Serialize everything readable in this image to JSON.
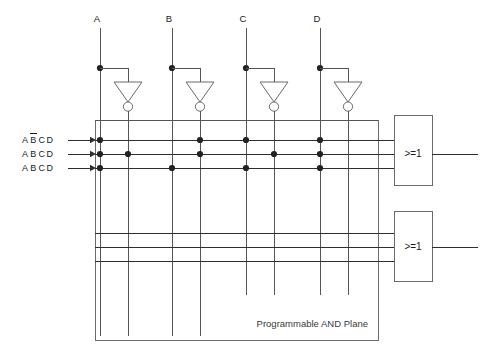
{
  "diagram": {
    "plane_label": "Programmable AND Plane",
    "colors": {
      "wire": "#555555",
      "wire_dark": "#2e2e2e",
      "dot": "#222222",
      "box": "#6b6b6b",
      "text": "#1b1b1b",
      "background": "#ffffff"
    }
  },
  "inputs": [
    {
      "label": "A",
      "x": 100,
      "inv_x": 128
    },
    {
      "label": "B",
      "x": 172,
      "inv_x": 200
    },
    {
      "label": "C",
      "x": 246,
      "inv_x": 274
    },
    {
      "label": "D",
      "x": 320,
      "inv_x": 348
    }
  ],
  "product_terms": [
    {
      "label_parts": [
        {
          "ch": "A",
          "bar": false
        },
        {
          "ch": "B",
          "bar": true
        },
        {
          "ch": "C",
          "bar": false
        },
        {
          "ch": "D",
          "bar": false
        }
      ],
      "y": 140
    },
    {
      "label_parts": [
        {
          "ch": "A",
          "bar": false
        },
        {
          "ch": "B",
          "bar": false
        },
        {
          "ch": "C",
          "bar": false
        },
        {
          "ch": "D",
          "bar": false
        }
      ],
      "y": 154
    },
    {
      "label_parts": [
        {
          "ch": "A",
          "bar": false
        },
        {
          "ch": "B",
          "bar": false
        },
        {
          "ch": "C",
          "bar": false
        },
        {
          "ch": "D",
          "bar": false
        }
      ],
      "y": 168
    }
  ],
  "connection_dots": [
    {
      "x": 100,
      "y": 140
    },
    {
      "x": 200,
      "y": 140
    },
    {
      "x": 246,
      "y": 140
    },
    {
      "x": 320,
      "y": 140
    },
    {
      "x": 100,
      "y": 154
    },
    {
      "x": 128,
      "y": 154
    },
    {
      "x": 200,
      "y": 154
    },
    {
      "x": 274,
      "y": 154
    },
    {
      "x": 320,
      "y": 154
    },
    {
      "x": 100,
      "y": 168
    },
    {
      "x": 172,
      "y": 168
    },
    {
      "x": 246,
      "y": 168
    },
    {
      "x": 320,
      "y": 168
    }
  ],
  "input_tap_dots": [
    {
      "x": 100,
      "y": 68
    },
    {
      "x": 172,
      "y": 68
    },
    {
      "x": 246,
      "y": 68
    },
    {
      "x": 320,
      "y": 68
    }
  ],
  "lower_lines": [
    {
      "y": 233
    },
    {
      "y": 247
    },
    {
      "y": 261
    }
  ],
  "or_gates": [
    {
      "label": ">=1",
      "x": 394,
      "y": 115,
      "w": 38,
      "h": 70,
      "out_y": 154
    },
    {
      "label": ">=1",
      "x": 394,
      "y": 211,
      "w": 38,
      "h": 70,
      "out_y": 247
    }
  ],
  "and_plane": {
    "x": 95,
    "y": 120,
    "w": 283,
    "h": 220
  }
}
